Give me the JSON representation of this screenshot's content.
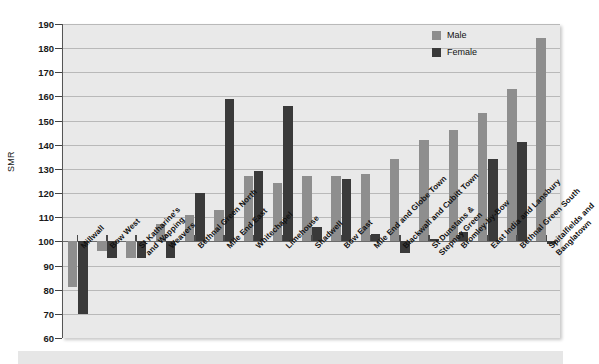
{
  "chart_data": {
    "type": "bar",
    "title": "",
    "xlabel": "",
    "ylabel": "SMR",
    "ylim": [
      60,
      190
    ],
    "ystep": 10,
    "grid": true,
    "baseline": 100,
    "legend_position": "top-right",
    "yticks": [
      190,
      180,
      170,
      160,
      150,
      140,
      130,
      120,
      110,
      100,
      90,
      80,
      70,
      60
    ],
    "categories": [
      "Millwall",
      "Bow West",
      "St Katharine's and Wapping",
      "Weavers",
      "Bethnal Green North",
      "Mile End East",
      "Whitechapel",
      "Limehouse",
      "Shadwell",
      "Bow East",
      "Mile End and Globe Town",
      "Blackwall and Cubitt Town",
      "St Dunstans & Stepney Green",
      "Bromley-by-Bow",
      "East India and Lansbury",
      "Bethnal Green South",
      "Spitalfields and Banglatown"
    ],
    "category_lines": [
      [
        "Millwall"
      ],
      [
        "Bow West"
      ],
      [
        "St Katharine's",
        "and Wapping"
      ],
      [
        "Weavers"
      ],
      [
        "Bethnal Green North"
      ],
      [
        "Mile End East"
      ],
      [
        "Whitechapel"
      ],
      [
        "Limehouse"
      ],
      [
        "Shadwell"
      ],
      [
        "Bow East"
      ],
      [
        "Mile End and Globe Town"
      ],
      [
        "Blackwall and Cubitt Town"
      ],
      [
        "St Dunstans &",
        "Stepney Green"
      ],
      [
        "Bromley-by-Bow"
      ],
      [
        "East India and Lansbury"
      ],
      [
        "Bethnal Green South"
      ],
      [
        "Spitalfields and",
        "Banglatown"
      ]
    ],
    "series": [
      {
        "name": "Male",
        "color": "#8e8e8e",
        "values": [
          81,
          96,
          93,
          107,
          111,
          113,
          127,
          124,
          127,
          127,
          128,
          134,
          142,
          146,
          153,
          163,
          184
        ]
      },
      {
        "name": "Female",
        "color": "#3a3a3a",
        "values": [
          70,
          93,
          93,
          93,
          120,
          159,
          129,
          156,
          106,
          126,
          103,
          95,
          101,
          104,
          134,
          141,
          99
        ]
      }
    ]
  },
  "legend": {
    "items": [
      {
        "label": "Male"
      },
      {
        "label": "Female"
      }
    ]
  },
  "colors": {
    "male": "#8e8e8e",
    "female": "#3a3a3a",
    "plot_background": "#e9e9e9",
    "gridline": "#b9b9b9",
    "baseline": "#6a6a6a"
  }
}
